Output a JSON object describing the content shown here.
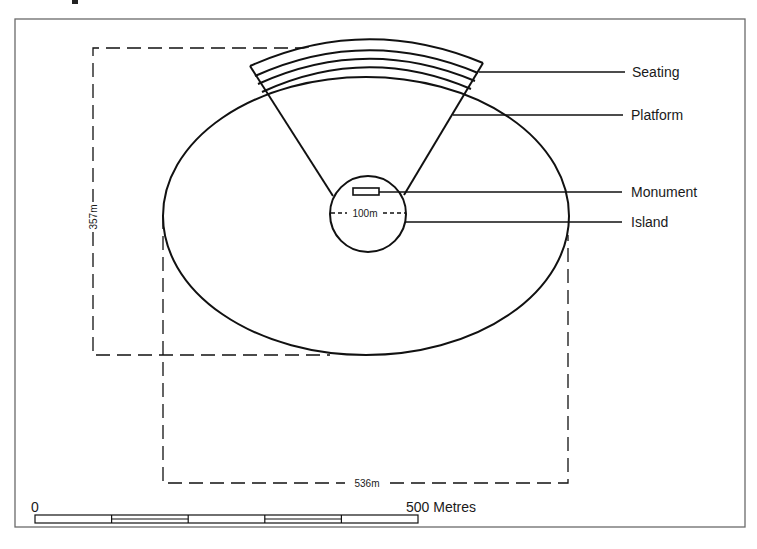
{
  "figure": {
    "type": "site-plan",
    "frame": {
      "x": 15,
      "y": 18,
      "width": 730,
      "height": 509
    }
  },
  "labels": {
    "seating": "Seating",
    "platform": "Platform",
    "monument": "Monument",
    "island": "Island"
  },
  "dimensions": {
    "height": "357m",
    "width": "536m",
    "island_diameter": "100m"
  },
  "scale_bar": {
    "start_label": "0",
    "end_label": "500 Metres",
    "segments": 5
  },
  "colors": {
    "line": "#111111",
    "frame": "#666666",
    "background": "#ffffff"
  }
}
